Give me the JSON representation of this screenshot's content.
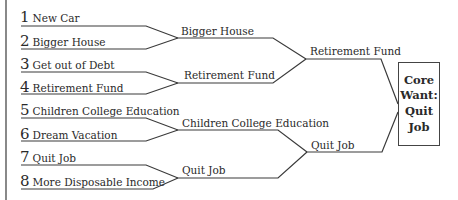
{
  "diagram": {
    "type": "bracket",
    "colors": {
      "line": "#3a3a3a",
      "text": "#2a2a2a",
      "background": "#ffffff"
    },
    "round1": [
      {
        "number": "1",
        "label": "New Car"
      },
      {
        "number": "2",
        "label": "Bigger House"
      },
      {
        "number": "3",
        "label": "Get out of Debt"
      },
      {
        "number": "4",
        "label": "Retirement Fund"
      },
      {
        "number": "5",
        "label": "Children College Education"
      },
      {
        "number": "6",
        "label": "Dream Vacation"
      },
      {
        "number": "7",
        "label": "Quit Job"
      },
      {
        "number": "8",
        "label": "More Disposable Income"
      }
    ],
    "round2": [
      {
        "label": "Bigger House"
      },
      {
        "label": "Retirement Fund"
      },
      {
        "label": "Children College Education"
      },
      {
        "label": "Quit Job"
      }
    ],
    "round3": [
      {
        "label": "Retirement Fund"
      },
      {
        "label": "Quit Job"
      }
    ],
    "winner": {
      "lines": [
        "Core",
        "Want:",
        "Quit",
        "Job"
      ]
    }
  }
}
